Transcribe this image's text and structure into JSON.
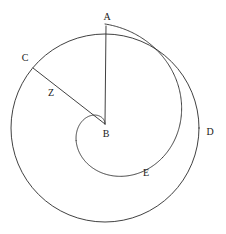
{
  "figure": {
    "name": "archimedean-spiral-in-circle",
    "background_color": "#ffffff",
    "stroke_color": "#2b2b2b",
    "label_color": "#1a1a1a",
    "width": 226,
    "height": 234
  },
  "labels": {
    "a": "A",
    "b": "B",
    "c": "C",
    "d": "D",
    "e": "E",
    "z": "Z"
  },
  "chart_data": {
    "type": "scatter",
    "title": "",
    "xlabel": "",
    "ylabel": "",
    "xlim": [
      0,
      226
    ],
    "ylim": [
      0,
      234
    ],
    "grid": false,
    "legend": "none",
    "points": [
      {
        "label": "A",
        "x": 106,
        "y": 26,
        "label_x": 107,
        "label_y": 17,
        "role": "spiral-start-on-circle"
      },
      {
        "label": "B",
        "x": 105,
        "y": 124,
        "label_x": 106,
        "label_y": 134,
        "role": "circle-center-and-spiral-pole"
      },
      {
        "label": "C",
        "x": 33,
        "y": 68,
        "label_x": 25,
        "label_y": 58,
        "role": "point-on-circle"
      },
      {
        "label": "D",
        "x": 198,
        "y": 130,
        "label_x": 210,
        "label_y": 132,
        "role": "point-on-circle-right"
      },
      {
        "label": "E",
        "x": 133,
        "y": 166,
        "label_x": 146,
        "label_y": 173,
        "role": "point-on-spiral-lower"
      },
      {
        "label": "Z",
        "x": 45,
        "y": 92,
        "label_x": 51,
        "label_y": 93,
        "role": "spiral-meets-radius-bc"
      }
    ],
    "shapes": [
      {
        "type": "circle",
        "name": "outer-circle",
        "cx": 105,
        "cy": 128,
        "r": 94
      },
      {
        "type": "segment",
        "name": "radius-ba",
        "x1": 105,
        "y1": 124,
        "x2": 106,
        "y2": 26
      },
      {
        "type": "segment",
        "name": "radius-bc",
        "x1": 105,
        "y1": 124,
        "x2": 33,
        "y2": 68
      },
      {
        "type": "spiral",
        "name": "archimedean-spiral",
        "pole_x": 105,
        "pole_y": 124,
        "start_r": 100,
        "turns": 1,
        "direction": "counterclockwise"
      }
    ]
  }
}
